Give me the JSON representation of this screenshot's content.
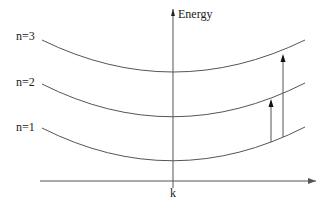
{
  "diagram": {
    "y_axis_label": "Energy",
    "x_axis_label": "k",
    "bands": [
      {
        "label": "n=3"
      },
      {
        "label": "n=2"
      },
      {
        "label": "n=1"
      }
    ],
    "transitions": [
      {
        "from": "n=1",
        "to": "n=2"
      },
      {
        "from": "n=1",
        "to": "n=3"
      }
    ],
    "colors": {
      "line": "#555555",
      "text": "#222222"
    }
  }
}
